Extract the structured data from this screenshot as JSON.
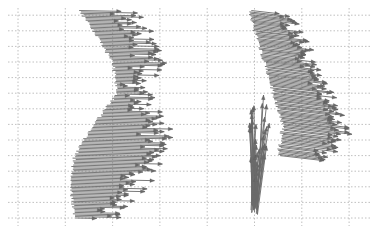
{
  "chart_data": {
    "type": "quiver",
    "title": "",
    "xlabel": "",
    "ylabel": "",
    "xlim": [
      0,
      7.5
    ],
    "ylim": [
      0,
      13.5
    ],
    "grid": true,
    "x_gridlines": [
      0,
      1,
      2,
      3,
      4,
      5,
      6,
      7
    ],
    "y_gridlines": [
      0,
      1,
      2,
      3,
      4,
      5,
      6,
      7,
      8,
      9,
      10,
      11,
      12,
      13
    ],
    "arrow_color": "#6a6a6a",
    "grid_color": "#b0b0b0",
    "series": [
      {
        "name": "left-field",
        "description": "Dense roughly horizontal arrows pointing right; bases trace a curved boundary bulging right at mid-height",
        "count": 150,
        "y_range": [
          0.0,
          13.3
        ],
        "base_x_profile": {
          "y": [
            0.0,
            2.0,
            4.0,
            6.0,
            8.0,
            10.0,
            12.0,
            13.3
          ],
          "x": [
            1.2,
            1.1,
            1.2,
            1.6,
            2.1,
            2.0,
            1.6,
            1.3
          ]
        },
        "tip_x_profile": {
          "y": [
            0.0,
            2.0,
            4.0,
            6.0,
            8.0,
            10.0,
            12.0,
            13.3
          ],
          "x": [
            1.8,
            2.5,
            2.8,
            3.0,
            2.5,
            2.8,
            2.6,
            2.2
          ]
        },
        "tip_jitter": 0.35,
        "slope": -0.06
      },
      {
        "name": "right-field-upper",
        "description": "Diagonal arrows pointing down-right, bases along a slanted boundary",
        "count": 110,
        "y_range": [
          4.0,
          13.3
        ],
        "base_x_profile": {
          "y": [
            4.0,
            6.0,
            8.0,
            10.0,
            12.0,
            13.3
          ],
          "x": [
            5.5,
            5.6,
            5.4,
            5.2,
            5.0,
            4.9
          ]
        },
        "tip_x_profile": {
          "y": [
            4.0,
            6.0,
            8.0,
            10.0,
            12.0,
            13.3
          ],
          "x": [
            6.4,
            6.9,
            6.6,
            6.2,
            6.0,
            5.6
          ]
        },
        "tip_jitter": 0.2,
        "slope": -0.35
      },
      {
        "name": "right-field-lower",
        "description": "Fan of arrows pointing upward from a common point near the bottom",
        "count": 40,
        "origin": [
          5.0,
          0.2
        ],
        "angle_range_deg": [
          62,
          100
        ],
        "length_range": [
          2.0,
          7.0
        ]
      }
    ]
  }
}
